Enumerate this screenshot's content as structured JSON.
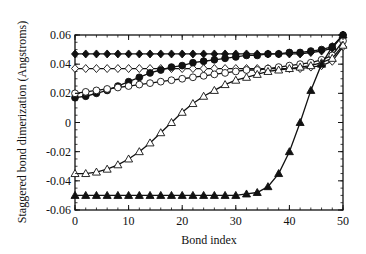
{
  "chart_data": {
    "type": "line",
    "title": "",
    "xlabel": "Bond index",
    "ylabel": "Staggered bond dimerization (Angstroms)",
    "xlim": [
      0,
      50
    ],
    "ylim": [
      -0.06,
      0.06
    ],
    "xticks": [
      0,
      10,
      20,
      30,
      40,
      50
    ],
    "xtick_labels": [
      "0",
      "10",
      "20",
      "30",
      "40",
      "50"
    ],
    "yticks": [
      -0.06,
      -0.04,
      -0.02,
      0,
      0.02,
      0.04,
      0.06
    ],
    "ytick_labels": [
      "-0.06",
      "-0.04",
      "-0.02",
      "0",
      "0.02",
      "0.04",
      "0.06"
    ],
    "grid": false,
    "legend": null,
    "x": [
      0,
      2,
      4,
      6,
      8,
      10,
      12,
      14,
      16,
      18,
      20,
      22,
      24,
      26,
      28,
      30,
      32,
      34,
      36,
      38,
      40,
      42,
      44,
      46,
      48,
      50
    ],
    "series": [
      {
        "name": "filled diamonds",
        "marker": "diamond-filled",
        "values": [
          0.047,
          0.047,
          0.047,
          0.047,
          0.047,
          0.047,
          0.047,
          0.047,
          0.047,
          0.047,
          0.047,
          0.047,
          0.047,
          0.047,
          0.047,
          0.047,
          0.047,
          0.047,
          0.047,
          0.047,
          0.047,
          0.047,
          0.048,
          0.049,
          0.051,
          0.06
        ]
      },
      {
        "name": "open diamonds",
        "marker": "diamond-open",
        "values": [
          0.037,
          0.037,
          0.037,
          0.037,
          0.037,
          0.037,
          0.037,
          0.037,
          0.037,
          0.037,
          0.037,
          0.037,
          0.037,
          0.037,
          0.037,
          0.037,
          0.037,
          0.037,
          0.037,
          0.037,
          0.037,
          0.037,
          0.038,
          0.039,
          0.042,
          0.052
        ]
      },
      {
        "name": "filled circles",
        "marker": "circle-filled",
        "values": [
          0.017,
          0.018,
          0.02,
          0.022,
          0.025,
          0.028,
          0.031,
          0.034,
          0.036,
          0.038,
          0.039,
          0.041,
          0.042,
          0.043,
          0.044,
          0.045,
          0.046,
          0.046,
          0.047,
          0.047,
          0.048,
          0.048,
          0.049,
          0.05,
          0.052,
          0.06
        ]
      },
      {
        "name": "open circles",
        "marker": "circle-open",
        "values": [
          0.02,
          0.021,
          0.022,
          0.023,
          0.024,
          0.025,
          0.026,
          0.027,
          0.028,
          0.029,
          0.03,
          0.031,
          0.032,
          0.033,
          0.034,
          0.035,
          0.036,
          0.036,
          0.037,
          0.038,
          0.039,
          0.04,
          0.041,
          0.043,
          0.046,
          0.056
        ]
      },
      {
        "name": "open triangles",
        "marker": "triangle-open",
        "values": [
          -0.035,
          -0.035,
          -0.034,
          -0.032,
          -0.029,
          -0.025,
          -0.02,
          -0.014,
          -0.007,
          0.0,
          0.007,
          0.013,
          0.018,
          0.022,
          0.026,
          0.029,
          0.031,
          0.033,
          0.035,
          0.036,
          0.037,
          0.038,
          0.039,
          0.041,
          0.044,
          0.053
        ]
      },
      {
        "name": "filled triangles",
        "marker": "triangle-filled",
        "values": [
          -0.05,
          -0.05,
          -0.05,
          -0.05,
          -0.05,
          -0.05,
          -0.05,
          -0.05,
          -0.05,
          -0.05,
          -0.05,
          -0.05,
          -0.05,
          -0.05,
          -0.05,
          -0.05,
          -0.049,
          -0.048,
          -0.044,
          -0.035,
          -0.02,
          0.0,
          0.022,
          0.04,
          0.052,
          0.06
        ]
      }
    ]
  },
  "colors": {
    "ink": "#111111",
    "background": "#ffffff"
  }
}
